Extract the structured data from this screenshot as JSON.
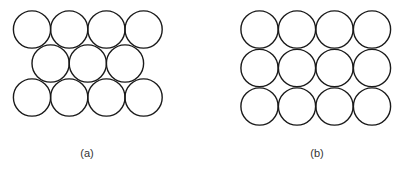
{
  "figure": {
    "stroke_color": "#1a1a1a",
    "radius": 18.6,
    "panels": [
      {
        "id": "a",
        "label": "(a)",
        "label_pos": [
          87,
          147
        ],
        "arrangement": "hexagonal",
        "rows": [
          {
            "y": 29.5,
            "x": [
              32,
              69.2,
              106.4,
              143.6
            ]
          },
          {
            "y": 63.5,
            "x": [
              50.6,
              87.8,
              125
            ]
          },
          {
            "y": 97.5,
            "x": [
              32,
              69.2,
              106.4,
              143.6
            ]
          }
        ]
      },
      {
        "id": "b",
        "label": "(b)",
        "label_pos": [
          317,
          147
        ],
        "arrangement": "square",
        "rows": [
          {
            "y": 29.5,
            "x": [
              259.5,
              297,
              334.5,
              372
            ]
          },
          {
            "y": 68,
            "x": [
              259.5,
              297,
              334.5,
              372
            ]
          },
          {
            "y": 106.5,
            "x": [
              259.5,
              297,
              334.5,
              372
            ]
          }
        ]
      }
    ]
  }
}
